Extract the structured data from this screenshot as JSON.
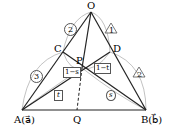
{
  "diagram": {
    "points": {
      "O": {
        "label": "O",
        "x": 91,
        "y": 12
      },
      "A": {
        "label": "A(a⃗)",
        "x": 22,
        "y": 110
      },
      "B": {
        "label": "B(b⃗)",
        "x": 146,
        "y": 110
      },
      "C": {
        "label": "C",
        "x": 63,
        "y": 52
      },
      "D": {
        "label": "D",
        "x": 110,
        "y": 52
      },
      "P": {
        "label": "P",
        "x": 82,
        "y": 68
      },
      "Q": {
        "label": "Q",
        "x": 77,
        "y": 110
      }
    },
    "ratios": {
      "OC": "2",
      "CA": "3",
      "OD": "1",
      "DB": "2",
      "CP": "1−s",
      "PD": "1−t",
      "AP": "t",
      "PB": "s"
    }
  }
}
